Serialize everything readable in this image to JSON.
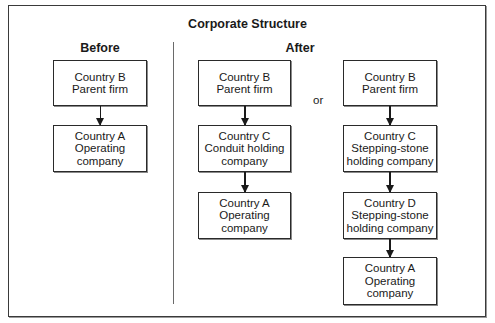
{
  "title": "Corporate Structure",
  "before": {
    "label": "Before",
    "boxes": [
      {
        "line1": "Country  B",
        "line2": "Parent firm"
      },
      {
        "line1": "Country  A",
        "line2": "Operating",
        "line3": "company"
      }
    ]
  },
  "after": {
    "label": "After",
    "separator": "or",
    "option1": {
      "boxes": [
        {
          "line1": "Country  B",
          "line2": "Parent firm"
        },
        {
          "line1": "Country  C",
          "line2": "Conduit holding",
          "line3": "company"
        },
        {
          "line1": "Country  A",
          "line2": "Operating",
          "line3": "company"
        }
      ]
    },
    "option2": {
      "boxes": [
        {
          "line1": "Country  B",
          "line2": "Parent firm"
        },
        {
          "line1": "Country  C",
          "line2": "Stepping-stone",
          "line3": "holding company"
        },
        {
          "line1": "Country  D",
          "line2": "Stepping-stone",
          "line3": "holding company"
        },
        {
          "line1": "Country  A",
          "line2": "Operating",
          "line3": "company"
        }
      ]
    }
  }
}
